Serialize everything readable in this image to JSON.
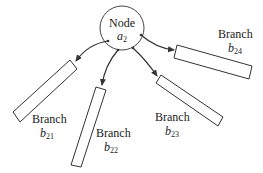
{
  "node": {
    "label": "Node",
    "symbol": "a",
    "subscript": "2"
  },
  "branches": [
    {
      "label": "Branch",
      "symbol": "b",
      "subscript": "21"
    },
    {
      "label": "Branch",
      "symbol": "b",
      "subscript": "22"
    },
    {
      "label": "Branch",
      "symbol": "b",
      "subscript": "23"
    },
    {
      "label": "Branch",
      "symbol": "b",
      "subscript": "24"
    }
  ],
  "colors": {
    "stroke": "#333333",
    "background": "#ffffff"
  }
}
